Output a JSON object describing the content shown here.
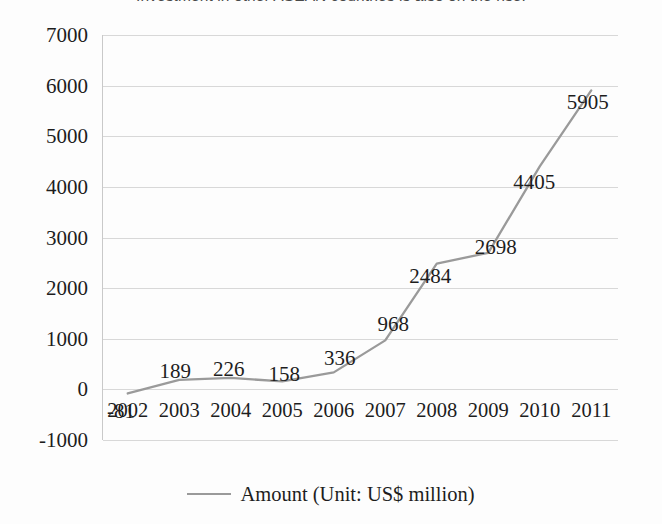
{
  "headline": {
    "cropped_text": "Investment in other ASEAN countries is also on the rise."
  },
  "chart_data": {
    "type": "line",
    "title": "",
    "subtitle": "",
    "xlabel": "",
    "ylabel": "",
    "categories": [
      "2002",
      "2003",
      "2004",
      "2005",
      "2006",
      "2007",
      "2008",
      "2009",
      "2010",
      "2011"
    ],
    "values": [
      -81,
      189,
      226,
      158,
      336,
      968,
      2484,
      2698,
      4405,
      5905
    ],
    "series": [
      {
        "name": "Amount (Unit: US$ million)",
        "values": [
          -81,
          189,
          226,
          158,
          336,
          968,
          2484,
          2698,
          4405,
          5905
        ],
        "color": "#9a9a9a"
      }
    ],
    "ylim": [
      -1000,
      7000
    ],
    "yticks": [
      7000,
      6000,
      5000,
      4000,
      3000,
      2000,
      1000,
      0,
      -1000
    ],
    "ytick_labels": [
      "7000",
      "6000",
      "5000",
      "4000",
      "3000",
      "2000",
      "1000",
      "0",
      "-1000"
    ],
    "data_labels": [
      "-81",
      "189",
      "226",
      "158",
      "336",
      "968",
      "2484",
      "2698",
      "4405",
      "5905"
    ],
    "grid": true,
    "legend_position": "bottom",
    "legend_entries": [
      "Amount (Unit: US$ million)"
    ],
    "line_color": "#9a9a9a",
    "gridline_color": "#d8d8d8",
    "axis_color": "#c9c9c9",
    "background_color": "#fdfdfd",
    "text_color": "#1d1d1d"
  },
  "legend": {
    "label": "Amount (Unit: US$ million)"
  }
}
